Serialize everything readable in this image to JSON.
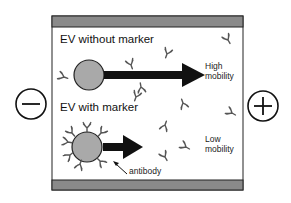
{
  "diagram": {
    "type": "electrophoresis-mobility-schematic",
    "electrodes": {
      "left": {
        "symbol": "minus",
        "label": "−"
      },
      "right": {
        "symbol": "plus",
        "label": "+"
      }
    },
    "panels": [
      {
        "title": "EV without marker",
        "mobility_label_line1": "High",
        "mobility_label_line2": "mobility",
        "arrow": "long"
      },
      {
        "title": "EV with marker",
        "mobility_label_line1": "Low",
        "mobility_label_line2": "mobility",
        "arrow": "short",
        "annotation": "antibody"
      }
    ],
    "colors": {
      "bar": "#8a8a8a",
      "ev_fill": "#a9a9a9",
      "stroke": "#111111",
      "antibody": "#555555"
    }
  }
}
